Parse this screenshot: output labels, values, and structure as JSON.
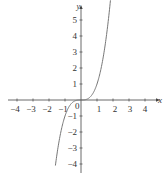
{
  "chart_data": {
    "type": "line",
    "title": "",
    "function": "y = x^3",
    "xlabel": "x",
    "ylabel": "y",
    "xlim": [
      -4.6,
      4.8
    ],
    "ylim": [
      -4.5,
      5.8
    ],
    "x_ticks": [
      -4,
      -3,
      -2,
      -1,
      1,
      2,
      3,
      4
    ],
    "y_ticks": [
      -4,
      -3,
      -2,
      -1,
      1,
      2,
      3,
      4,
      5
    ],
    "origin_label": "0",
    "grid": false,
    "series": [
      {
        "name": "y = x^3",
        "x": [
          -1.6,
          -1.4,
          -1.2,
          -1.0,
          -0.8,
          -0.6,
          -0.4,
          -0.2,
          0,
          0.2,
          0.4,
          0.6,
          0.8,
          1.0,
          1.2,
          1.4,
          1.6,
          1.8
        ],
        "y": [
          -4.1,
          -2.74,
          -1.73,
          -1.0,
          -0.51,
          -0.22,
          -0.06,
          -0.01,
          0,
          0.01,
          0.06,
          0.22,
          0.51,
          1.0,
          1.73,
          2.74,
          4.1,
          5.83
        ]
      }
    ]
  },
  "labels": {
    "x_axis": "x",
    "y_axis": "y",
    "origin": "0",
    "x_ticks": [
      "−4",
      "−3",
      "−2",
      "−1",
      "1",
      "2",
      "3",
      "4"
    ],
    "y_ticks": [
      "5",
      "4",
      "3",
      "2",
      "1",
      "−1",
      "−2",
      "−3",
      "−4"
    ]
  },
  "colors": {
    "axis": "#444444",
    "curve": "#777777",
    "text": "#333333"
  }
}
